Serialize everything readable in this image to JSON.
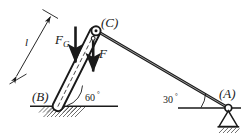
{
  "figure": {
    "type": "statics-free-body-diagram",
    "stroke_color": "#1a1a1a",
    "background_color": "#ffffff",
    "labels": {
      "point_a": "(A)",
      "point_b": "(B)",
      "point_c": "(C)",
      "force_weight": "F",
      "force_weight_sub": "G",
      "force_applied": "F",
      "length": "l",
      "angle_strut": "60",
      "angle_strut_unit": "°",
      "angle_beam": "30",
      "angle_beam_unit": "°"
    },
    "geometry": {
      "point_a": [
        228,
        108
      ],
      "point_b": [
        58,
        106
      ],
      "point_c": [
        96,
        31
      ],
      "ground_left_line": [
        [
          30,
          106
        ],
        [
          118,
          106
        ]
      ],
      "ground_right_line": [
        [
          178,
          108
        ],
        [
          241,
          108
        ]
      ],
      "beam_c_to_a": [
        [
          96,
          31
        ],
        [
          228,
          108
        ]
      ],
      "strut_b_to_c": [
        [
          58,
          106
        ],
        [
          95,
          32
        ]
      ],
      "dimension_line": [
        [
          15,
          79
        ],
        [
          52,
          14
        ]
      ],
      "force_g_arrow": [
        [
          75,
          27
        ],
        [
          75,
          67
        ]
      ],
      "force_arrow": [
        [
          93,
          38
        ],
        [
          93,
          76
        ]
      ]
    }
  }
}
